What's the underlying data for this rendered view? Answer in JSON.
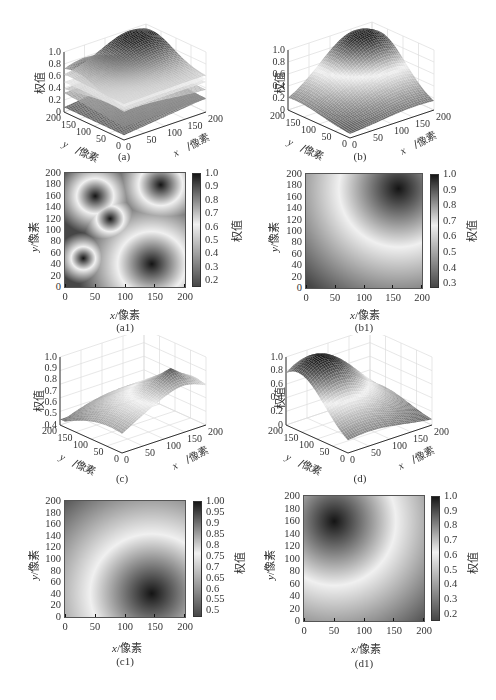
{
  "common": {
    "x_label_var": "x",
    "x_label_unit": "/像素",
    "y_label_var": "y",
    "y_label_unit": "/像素",
    "z_label": "权值",
    "colorbar_label": "权值",
    "axis_ticks_xy": [
      "0",
      "50",
      "100",
      "150",
      "200"
    ],
    "axis_ticks_y_heatmap": [
      "0",
      "20",
      "40",
      "60",
      "80",
      "100",
      "120",
      "140",
      "160",
      "180",
      "200"
    ]
  },
  "panels": {
    "a": {
      "caption": "(a)",
      "zticks": [
        "0",
        "0.2",
        "0.4",
        "0.6",
        "0.8",
        "1.0"
      ]
    },
    "b": {
      "caption": "(b)",
      "zticks": [
        "0",
        "0.2",
        "0.4",
        "0.6",
        "0.8",
        "1.0"
      ]
    },
    "c": {
      "caption": "(c)",
      "zticks": [
        "0.4",
        "0.5",
        "0.6",
        "0.7",
        "0.8",
        "0.9",
        "1.0"
      ]
    },
    "d": {
      "caption": "(d)",
      "zticks": [
        "0",
        "0.2",
        "0.4",
        "0.6",
        "0.8",
        "1.0"
      ]
    },
    "a1": {
      "caption": "(a1)",
      "cbticks": [
        "0.2",
        "0.3",
        "0.4",
        "0.5",
        "0.6",
        "0.7",
        "0.8",
        "0.9",
        "1.0"
      ]
    },
    "b1": {
      "caption": "(b1)",
      "cbticks": [
        "0.3",
        "0.4",
        "0.5",
        "0.6",
        "0.7",
        "0.8",
        "0.9",
        "1.0"
      ]
    },
    "c1": {
      "caption": "(c1)",
      "cbticks": [
        "0.5",
        "0.55",
        "0.6",
        "0.65",
        "0.7",
        "0.75",
        "0.8",
        "0.85",
        "0.9",
        "0.95",
        "1.00"
      ]
    },
    "d1": {
      "caption": "(d1)",
      "cbticks": [
        "0.2",
        "0.3",
        "0.4",
        "0.5",
        "0.6",
        "0.7",
        "0.8",
        "0.9",
        "1.0"
      ]
    }
  },
  "chart_data": [
    {
      "id": "a",
      "type": "surface3d",
      "title": "(a)",
      "xlabel": "x/像素",
      "ylabel": "y/像素",
      "zlabel": "权值",
      "xlim": [
        0,
        200
      ],
      "ylim": [
        0,
        200
      ],
      "zlim": [
        0,
        1.0
      ],
      "description": "Four overlapping weight surfaces (one per seed point) shown in 3D",
      "peaks": [
        {
          "x": 160,
          "y": 180,
          "peak": 1.0
        },
        {
          "x": 50,
          "y": 160,
          "peak": 0.85
        },
        {
          "x": 75,
          "y": 120,
          "peak": 0.6
        },
        {
          "x": 30,
          "y": 50,
          "peak": 0.3
        },
        {
          "x": 145,
          "y": 40,
          "peak": 0.3
        }
      ]
    },
    {
      "id": "b",
      "type": "surface3d",
      "title": "(b)",
      "xlabel": "x/像素",
      "ylabel": "y/像素",
      "zlabel": "权值",
      "xlim": [
        0,
        200
      ],
      "ylim": [
        0,
        200
      ],
      "zlim": [
        0,
        1.0
      ],
      "peaks": [
        {
          "x": 160,
          "y": 175,
          "peak": 1.0
        }
      ],
      "min_value": 0.3
    },
    {
      "id": "c",
      "type": "surface3d",
      "title": "(c)",
      "xlabel": "x/像素",
      "ylabel": "y/像素",
      "zlabel": "权值",
      "xlim": [
        0,
        200
      ],
      "ylim": [
        0,
        200
      ],
      "zlim": [
        0.4,
        1.0
      ],
      "peaks": [
        {
          "x": 145,
          "y": 40,
          "peak": 1.0
        }
      ],
      "min_value": 0.45
    },
    {
      "id": "d",
      "type": "surface3d",
      "title": "(d)",
      "xlabel": "x/像素",
      "ylabel": "y/像素",
      "zlabel": "权值",
      "xlim": [
        0,
        200
      ],
      "ylim": [
        0,
        200
      ],
      "zlim": [
        0,
        1.0
      ],
      "peaks": [
        {
          "x": 50,
          "y": 160,
          "peak": 1.0
        }
      ],
      "min_value": 0.15
    },
    {
      "id": "a1",
      "type": "heatmap",
      "title": "(a1)",
      "xlabel": "x/像素",
      "ylabel": "y/像素",
      "colorbar_label": "权值",
      "xlim": [
        0,
        200
      ],
      "ylim": [
        0,
        200
      ],
      "clim": [
        0.15,
        1.0
      ],
      "centers": [
        {
          "x": 160,
          "y": 180,
          "r": 45
        },
        {
          "x": 50,
          "y": 160,
          "r": 38
        },
        {
          "x": 75,
          "y": 120,
          "r": 28
        },
        {
          "x": 30,
          "y": 50,
          "r": 25
        },
        {
          "x": 145,
          "y": 40,
          "r": 70
        }
      ]
    },
    {
      "id": "b1",
      "type": "heatmap",
      "title": "(b1)",
      "xlabel": "x/像素",
      "ylabel": "y/像素",
      "colorbar_label": "权值",
      "xlim": [
        0,
        200
      ],
      "ylim": [
        0,
        200
      ],
      "clim": [
        0.27,
        1.0
      ],
      "centers": [
        {
          "x": 160,
          "y": 175,
          "r": 200
        }
      ]
    },
    {
      "id": "c1",
      "type": "heatmap",
      "title": "(c1)",
      "xlabel": "x/像素",
      "ylabel": "y/像素",
      "colorbar_label": "权值",
      "xlim": [
        0,
        200
      ],
      "ylim": [
        0,
        200
      ],
      "clim": [
        0.47,
        1.0
      ],
      "centers": [
        {
          "x": 145,
          "y": 40,
          "r": 200
        }
      ]
    },
    {
      "id": "d1",
      "type": "heatmap",
      "title": "(d1)",
      "xlabel": "x/像素",
      "ylabel": "y/像素",
      "colorbar_label": "权值",
      "xlim": [
        0,
        200
      ],
      "ylim": [
        0,
        200
      ],
      "clim": [
        0.15,
        1.0
      ],
      "centers": [
        {
          "x": 50,
          "y": 160,
          "r": 200
        }
      ]
    }
  ]
}
